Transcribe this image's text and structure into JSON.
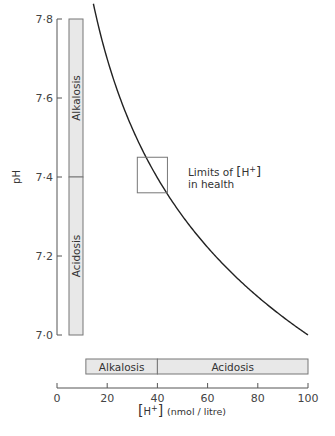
{
  "chart_data": {
    "type": "line",
    "title": "",
    "xlabel": "[H+] (nmol / litre)",
    "xlabel_parts": {
      "bracket_open": "[",
      "ion": "H",
      "charge": "+",
      "bracket_close": "]",
      "units": "(nmol / litre)"
    },
    "ylabel": "pH",
    "xlim": [
      0,
      100
    ],
    "ylim": [
      7.0,
      7.8
    ],
    "x_ticks": [
      0,
      20,
      40,
      60,
      80,
      100
    ],
    "x_tick_labels": [
      "0",
      "20",
      "40",
      "60",
      "80",
      "100"
    ],
    "y_ticks": [
      7.0,
      7.2,
      7.4,
      7.6,
      7.8
    ],
    "y_tick_labels": [
      "7·0",
      "7·2",
      "7·4",
      "7·6",
      "7·8"
    ],
    "grid": false,
    "series": [
      {
        "name": "pH vs [H+]",
        "relation": "pH = 9 - log10([H+] nmol/L)",
        "x": [
          14.5,
          16,
          20,
          25,
          30,
          35,
          40,
          45,
          50,
          60,
          70,
          80,
          90,
          100
        ],
        "y": [
          7.84,
          7.8,
          7.7,
          7.6,
          7.52,
          7.46,
          7.4,
          7.35,
          7.3,
          7.22,
          7.15,
          7.1,
          7.05,
          7.0
        ]
      }
    ],
    "bands": {
      "vertical_ph_bar": [
        {
          "label": "Alkalosis",
          "from": 7.4,
          "to": 7.8
        },
        {
          "label": "Acidosis",
          "from": 7.0,
          "to": 7.4
        }
      ],
      "horizontal_h_bar": [
        {
          "label": "Alkalosis",
          "from": 11.5,
          "to": 40
        },
        {
          "label": "Acidosis",
          "from": 40,
          "to": 100
        }
      ]
    },
    "annotations": [
      {
        "label_line1": "Limits of [H+]",
        "label_line1_parts": {
          "text": "Limits of ",
          "bracket_open": "[",
          "ion": "H",
          "charge": "+",
          "bracket_close": "]"
        },
        "label_line2": "in health",
        "box": {
          "x_from": 32,
          "x_to": 44,
          "y_from": 7.36,
          "y_to": 7.45
        }
      }
    ],
    "colors": {
      "line": "#222222",
      "axis": "#555555",
      "band_fill": "#e8e8e8",
      "band_stroke": "#777777"
    }
  }
}
